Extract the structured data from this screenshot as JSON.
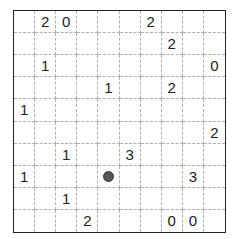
{
  "puzzle": {
    "rows": 10,
    "cols": 10,
    "grid": [
      [
        "",
        "2",
        "0",
        "",
        "",
        "",
        "2",
        "",
        "",
        ""
      ],
      [
        "",
        "",
        "",
        "",
        "",
        "",
        "",
        "2",
        "",
        ""
      ],
      [
        "",
        "1",
        "",
        "",
        "",
        "",
        "",
        "",
        "",
        "0"
      ],
      [
        "",
        "",
        "",
        "",
        "1",
        "",
        "",
        "2",
        "",
        ""
      ],
      [
        "1",
        "",
        "",
        "",
        "",
        "",
        "",
        "",
        "",
        ""
      ],
      [
        "",
        "",
        "",
        "",
        "",
        "",
        "",
        "",
        "",
        "2"
      ],
      [
        "",
        "",
        "1",
        "",
        "",
        "3",
        "",
        "",
        "",
        ""
      ],
      [
        "1",
        "",
        "",
        "",
        "•",
        "",
        "",
        "",
        "3",
        ""
      ],
      [
        "",
        "",
        "1",
        "",
        "",
        "",
        "",
        "",
        "",
        ""
      ],
      [
        "",
        "",
        "",
        "2",
        "",
        "",
        "",
        "0",
        "0",
        ""
      ]
    ],
    "markers": [
      {
        "row": 7,
        "col": 4,
        "type": "dot",
        "color": "#555555"
      }
    ]
  }
}
